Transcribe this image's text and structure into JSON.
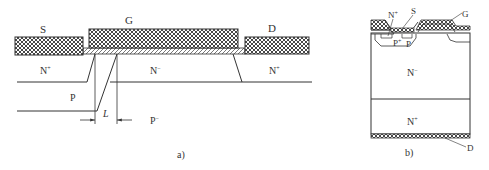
{
  "figure_a": {
    "caption": "a)",
    "labels": {
      "source": "S",
      "gate": "G",
      "drain": "D",
      "n_plus_left": "N",
      "n_plus_left_sup": "+",
      "n_minus": "N",
      "n_minus_sup": "−",
      "n_plus_right": "N",
      "n_plus_right_sup": "+",
      "p": "P",
      "p_minus": "P",
      "p_minus_sup": "−",
      "length": "L"
    }
  },
  "figure_b": {
    "caption": "b)",
    "labels": {
      "n_plus_top": "N",
      "n_plus_top_sup": "+",
      "source": "S",
      "gate": "G",
      "p_plus": "P",
      "p_plus_sup": "+",
      "p": "P",
      "n_minus": "N",
      "n_minus_sup": "−",
      "n_plus_bottom": "N",
      "n_plus_bottom_sup": "+",
      "drain": "D"
    }
  },
  "colors": {
    "line": "#333333",
    "background": "#ffffff"
  }
}
